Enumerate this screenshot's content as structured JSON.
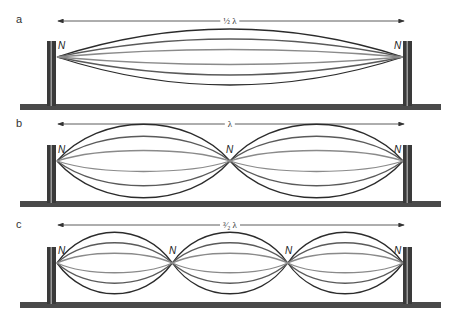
{
  "figure": {
    "panels": [
      {
        "id": "a",
        "label": "a",
        "dimension_label": "½ λ",
        "node_label": "N",
        "node_count": 2,
        "loops": 1
      },
      {
        "id": "b",
        "label": "b",
        "dimension_label": "λ",
        "node_label": "N",
        "node_count": 3,
        "loops": 2
      },
      {
        "id": "c",
        "label": "c",
        "dimension_label": "³⁄₂ λ",
        "node_label": "N",
        "node_count": 4,
        "loops": 3
      }
    ],
    "colors": {
      "outer_curve": "#2b2b2b",
      "middle_curve": "#5a5a5a",
      "inner_curve": "#8a8a8a",
      "post": "#3a3a3a",
      "post_highlight": "#9a9a9a",
      "ground": "#4a4a4a",
      "arrow": "#333333"
    }
  }
}
